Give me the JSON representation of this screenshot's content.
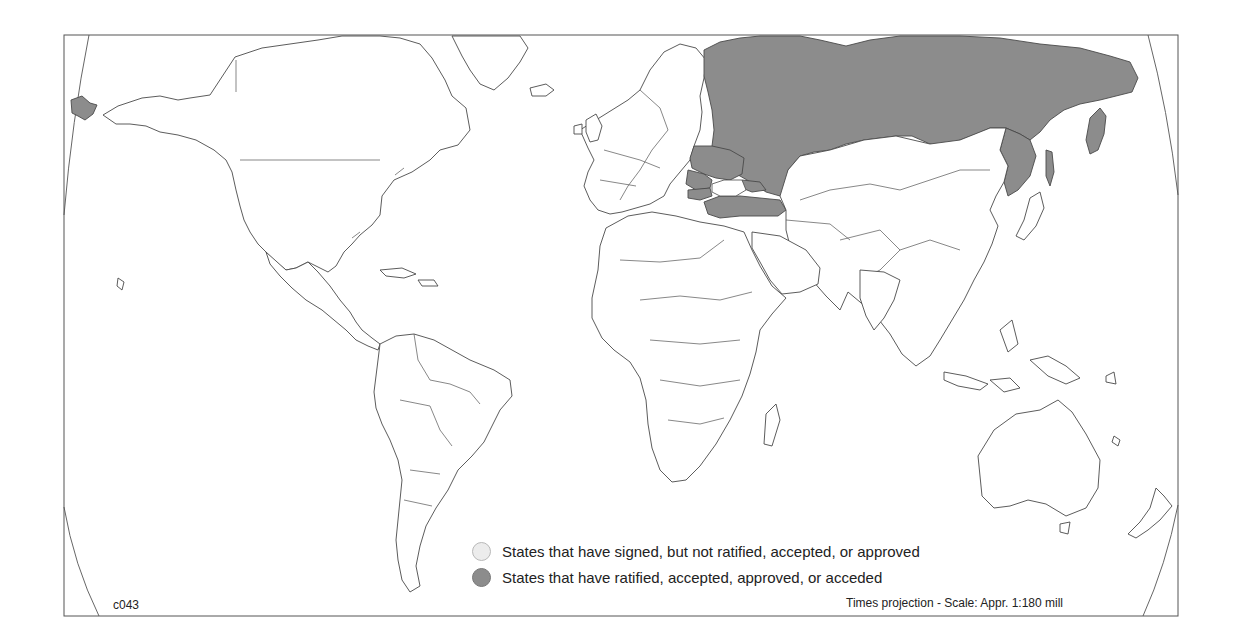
{
  "map": {
    "projection_note": "Times projection - Scale: Appr. 1:180 mill",
    "code": "c043",
    "colors": {
      "ratified": "#8c8c8c",
      "signed": "#ececec",
      "not_party": "#ffffff",
      "outline": "#4a4a4a"
    },
    "shaded_states": [
      {
        "name": "Russia",
        "status": "ratified"
      },
      {
        "name": "Ukraine",
        "status": "ratified"
      },
      {
        "name": "Romania",
        "status": "ratified"
      },
      {
        "name": "Bulgaria",
        "status": "ratified"
      },
      {
        "name": "Turkey",
        "status": "ratified"
      },
      {
        "name": "Georgia",
        "status": "ratified"
      }
    ]
  },
  "legend": {
    "items": [
      {
        "label": "States that have signed, but not ratified, accepted, or approved",
        "color": "#ececec"
      },
      {
        "label": "States that have ratified, accepted, approved, or acceded",
        "color": "#8c8c8c"
      }
    ]
  }
}
